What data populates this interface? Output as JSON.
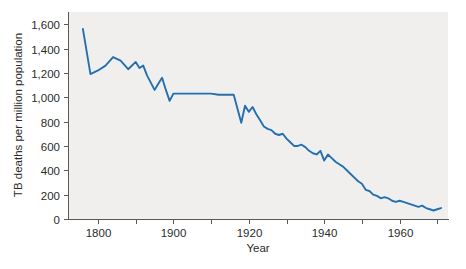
{
  "figure": {
    "background_color": "#ffffff",
    "plot_background_color": "#f0efed",
    "line_color": "#2e6da4",
    "axis_color": "#595959",
    "text_color": "#2b2b2b"
  },
  "labels": {
    "xlabel": "Year",
    "ylabel": "TB deaths per million population",
    "y_ticks": [
      "0",
      "200",
      "400",
      "600",
      "800",
      "1,000",
      "1,200",
      "1,400",
      "1,600"
    ],
    "x_ticks": [
      "1800",
      "1900",
      "1920",
      "1940",
      "1960"
    ]
  },
  "chart_data": {
    "type": "line",
    "title": "",
    "xlabel": "Year",
    "ylabel": "TB deaths per million population",
    "xlim": [
      1780,
      1972
    ],
    "ylim": [
      0,
      1700
    ],
    "grid": false,
    "legend": "none",
    "x_tick_values": [
      1800,
      1900,
      1920,
      1940,
      1960
    ],
    "y_tick_values": [
      0,
      200,
      400,
      600,
      800,
      1000,
      1200,
      1400,
      1600
    ],
    "axis_note": "x-axis is compressed before 1900; ticks are evenly spaced in pixels",
    "series": [
      {
        "name": "TB deaths per million population",
        "color": "#2e6da4",
        "x": [
          1780,
          1790,
          1800,
          1810,
          1820,
          1830,
          1840,
          1850,
          1855,
          1860,
          1865,
          1870,
          1875,
          1880,
          1885,
          1890,
          1895,
          1900,
          1902,
          1904,
          1906,
          1908,
          1910,
          1912,
          1914,
          1916,
          1918,
          1919,
          1920,
          1921,
          1922,
          1923,
          1924,
          1925,
          1926,
          1927,
          1928,
          1929,
          1930,
          1931,
          1932,
          1933,
          1934,
          1935,
          1936,
          1937,
          1938,
          1939,
          1940,
          1941,
          1942,
          1943,
          1944,
          1945,
          1946,
          1947,
          1948,
          1949,
          1950,
          1951,
          1952,
          1953,
          1954,
          1955,
          1956,
          1957,
          1958,
          1959,
          1960,
          1961,
          1962,
          1963,
          1964,
          1965,
          1966,
          1967,
          1968,
          1969,
          1970,
          1971
        ],
        "y": [
          1560,
          1190,
          1220,
          1260,
          1330,
          1300,
          1230,
          1290,
          1240,
          1260,
          1180,
          1120,
          1060,
          1110,
          1160,
          1060,
          970,
          1030,
          1030,
          1030,
          1030,
          1030,
          1030,
          1020,
          1020,
          1020,
          790,
          930,
          880,
          920,
          860,
          810,
          760,
          740,
          730,
          700,
          690,
          700,
          660,
          630,
          600,
          600,
          610,
          590,
          560,
          540,
          530,
          560,
          480,
          530,
          500,
          470,
          450,
          430,
          400,
          370,
          340,
          310,
          290,
          240,
          230,
          200,
          190,
          170,
          180,
          170,
          150,
          140,
          150,
          140,
          130,
          120,
          110,
          100,
          110,
          90,
          80,
          70,
          80,
          90
        ]
      }
    ]
  }
}
